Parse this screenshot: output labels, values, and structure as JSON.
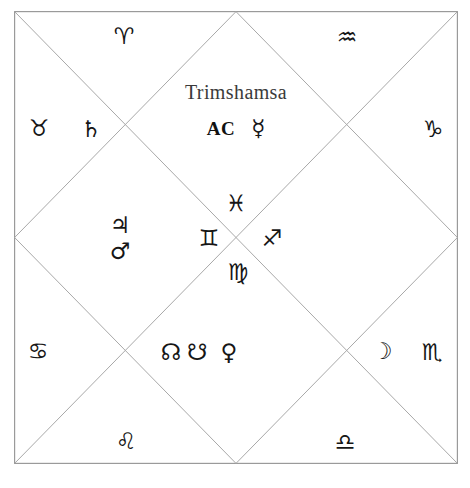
{
  "chart": {
    "title": "Trimshamsa",
    "ascendant_label": "AC",
    "style": "north-indian-diamond",
    "line_color": "#a8a8a8",
    "border_color": "#9a9a9a",
    "glyph_color": "#161616",
    "background": "#ffffff"
  },
  "glyphs": {
    "aries": "♈",
    "taurus": "♉",
    "gemini": "♊",
    "cancer": "♋",
    "leo": "♌",
    "virgo": "♍",
    "libra": "♎",
    "scorpio": "♏",
    "sagittarius": "♐",
    "capricorn": "♑",
    "aquarius": "♒",
    "pisces": "♓",
    "mercury": "☿",
    "venus": "♀",
    "mars": "♂",
    "jupiter": "♃",
    "saturn": "♄",
    "moon": "☽",
    "rahu": "☊",
    "ketu": "☋"
  },
  "houses": [
    {
      "id": "house-1-top-center",
      "position": "top-center-diamond",
      "sign_glyph": "",
      "sign_name": "",
      "contents": [
        "AC",
        "☿"
      ],
      "content_names": [
        "ascendant",
        "mercury"
      ]
    },
    {
      "id": "house-2-top-left",
      "position": "top-left-triangle",
      "sign_glyph": "♈",
      "sign_name": "aries",
      "contents": [],
      "content_names": []
    },
    {
      "id": "house-3-left-upper",
      "position": "left-upper-triangle",
      "sign_glyph": "♉",
      "sign_name": "taurus",
      "contents": [
        "♄"
      ],
      "content_names": [
        "saturn"
      ]
    },
    {
      "id": "house-4-left-center",
      "position": "left-center-diamond",
      "sign_glyph": "♊",
      "sign_name": "gemini",
      "contents": [
        "♃",
        "♂"
      ],
      "content_names": [
        "jupiter",
        "mars"
      ]
    },
    {
      "id": "house-5-left-lower",
      "position": "left-lower-triangle",
      "sign_glyph": "♋",
      "sign_name": "cancer",
      "contents": [],
      "content_names": []
    },
    {
      "id": "house-6-bottom-left",
      "position": "bottom-left-triangle",
      "sign_glyph": "♌",
      "sign_name": "leo",
      "contents": [],
      "content_names": []
    },
    {
      "id": "house-7-bottom-center",
      "position": "bottom-center-diamond",
      "sign_glyph": "♍",
      "sign_name": "virgo",
      "contents": [
        "☊",
        "☋",
        "♀"
      ],
      "content_names": [
        "rahu",
        "ketu",
        "venus"
      ]
    },
    {
      "id": "house-8-bottom-right",
      "position": "bottom-right-triangle",
      "sign_glyph": "♎",
      "sign_name": "libra",
      "contents": [],
      "content_names": []
    },
    {
      "id": "house-9-right-lower",
      "position": "right-lower-triangle",
      "sign_glyph": "♏",
      "sign_name": "scorpio",
      "contents": [
        "☽"
      ],
      "content_names": [
        "moon"
      ]
    },
    {
      "id": "house-10-right-center",
      "position": "right-center-diamond",
      "sign_glyph": "♐",
      "sign_name": "sagittarius",
      "contents": [],
      "content_names": []
    },
    {
      "id": "house-11-right-upper",
      "position": "right-upper-triangle",
      "sign_glyph": "♑",
      "sign_name": "capricorn",
      "contents": [],
      "content_names": []
    },
    {
      "id": "house-12-top-right",
      "position": "top-right-triangle",
      "sign_glyph": "♒",
      "sign_name": "aquarius",
      "contents": [],
      "content_names": []
    }
  ],
  "center_inner_diamond": {
    "top_sign": "♓",
    "top_sign_name": "pisces",
    "left_sign": "♊",
    "left_sign_name": "gemini",
    "right_sign": "♐",
    "right_sign_name": "sagittarius",
    "bottom_sign": "♍",
    "bottom_sign_name": "virgo"
  },
  "artifact": {
    "text": " "
  }
}
